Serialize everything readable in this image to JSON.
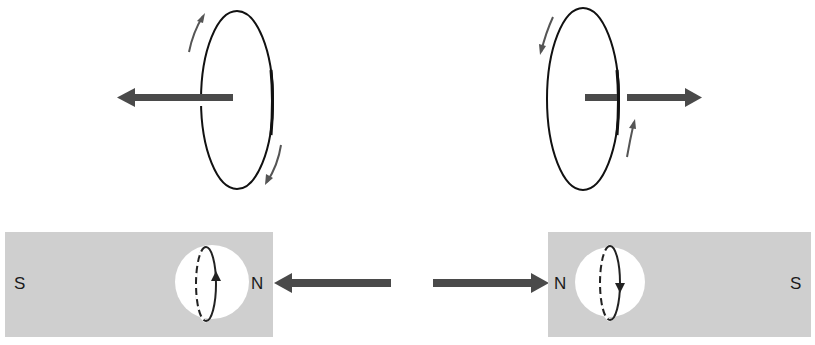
{
  "colors": {
    "background": "#ffffff",
    "magnet_fill": "#cfcfcf",
    "arrow": "#4a4a4a",
    "loop_stroke": "#111111",
    "hole_fill": "#ffffff"
  },
  "top_left_loop": {
    "axis_arrow_direction": "left",
    "current_arrows": [
      "up-on-left-side",
      "down-on-right-side"
    ]
  },
  "top_right_loop": {
    "axis_arrow_direction": "right",
    "current_arrows": [
      "down-on-left-side",
      "up-on-right-side"
    ]
  },
  "left_magnet": {
    "left_label": "S",
    "right_label": "N",
    "loop_arrow": "up",
    "field_arrow_direction": "left"
  },
  "right_magnet": {
    "left_label": "N",
    "right_label": "S",
    "loop_arrow": "down",
    "field_arrow_direction": "right"
  }
}
